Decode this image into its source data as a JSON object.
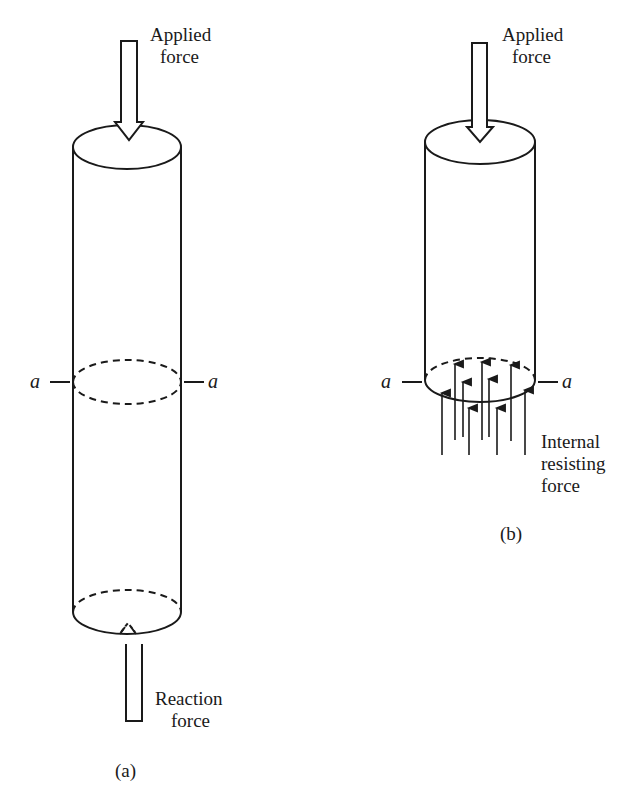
{
  "figure_a": {
    "applied_label_line1": "Applied",
    "applied_label_line2": "force",
    "section_left": "a",
    "section_right": "a",
    "reaction_label_line1": "Reaction",
    "reaction_label_line2": "force",
    "caption": "(a)"
  },
  "figure_b": {
    "applied_label_line1": "Applied",
    "applied_label_line2": "force",
    "section_left": "a",
    "section_right": "a",
    "internal_label_line1": "Internal",
    "internal_label_line2": "resisting",
    "internal_label_line3": "force",
    "caption": "(b)"
  },
  "colors": {
    "ink": "#1a1a1a",
    "background": "#ffffff"
  }
}
